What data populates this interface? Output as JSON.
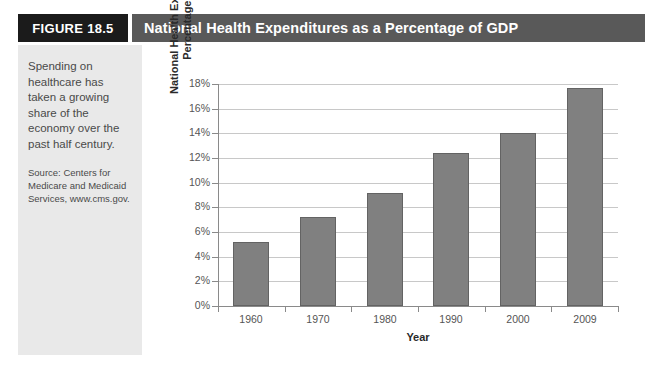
{
  "figure": {
    "tab_label": "FIGURE 18.5",
    "title": "National Health Expenditures as a Percentage of GDP",
    "caption": "Spending on healthcare has taken a growing share of the economy over the past half century.",
    "source": "Source: Centers for Medicare and Medicaid Services, www.cms.gov."
  },
  "colors": {
    "tab_background": "#1b1b1b",
    "titlebar_background": "#595959",
    "sidebar_background": "#e9e9e9",
    "bar_fill": "#808080",
    "bar_border": "#636363",
    "gridline": "#c8c8c8",
    "axis": "#8a8a8a"
  },
  "chart_data": {
    "type": "bar",
    "title": "National Health Expenditures as a Percentage of GDP",
    "xlabel": "Year",
    "ylabel": "National Health Expenditures as Percentage of GDP",
    "ylabel_line1": "National Health Expenditures as",
    "ylabel_line2": "Percentage of GDP",
    "categories": [
      "1960",
      "1970",
      "1980",
      "1990",
      "2000",
      "2009"
    ],
    "values": [
      5.2,
      7.2,
      9.2,
      12.4,
      14.0,
      17.7
    ],
    "ylim": [
      0,
      18
    ],
    "ytick_values": [
      0,
      2,
      4,
      6,
      8,
      10,
      12,
      14,
      16,
      18
    ],
    "ytick_labels": [
      "0%",
      "2%",
      "4%",
      "6%",
      "8%",
      "10%",
      "12%",
      "14%",
      "16%",
      "18%"
    ],
    "grid": true,
    "legend": false
  }
}
